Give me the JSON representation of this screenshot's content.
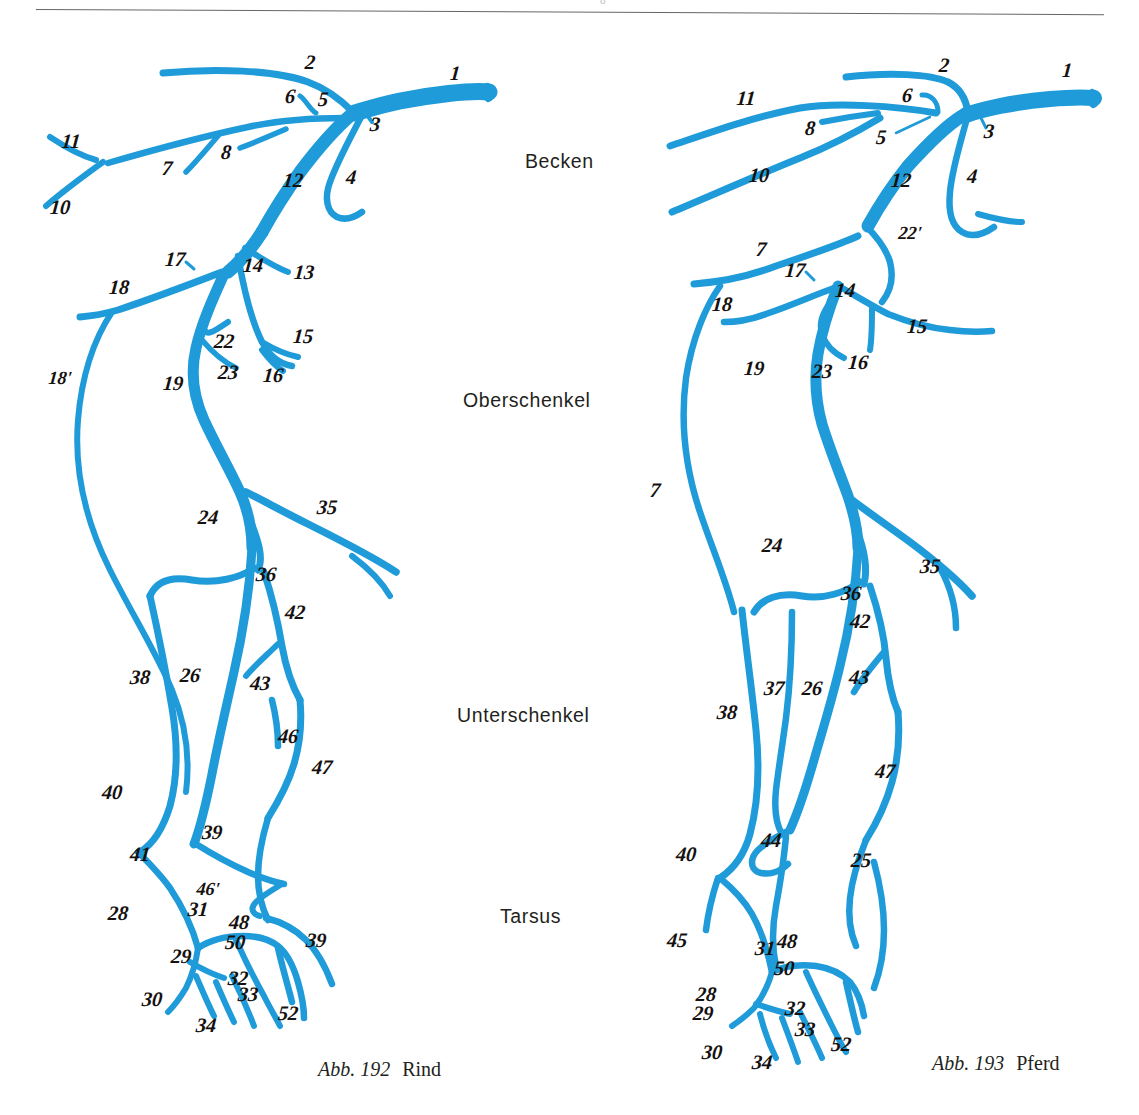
{
  "page": {
    "background": "#ffffff",
    "vessel_color": "#1f9bd9",
    "label_color": "#15110f",
    "rule_color": "#63676b",
    "header_ghost": "o"
  },
  "regions": [
    {
      "label": "Becken",
      "x": 525,
      "y": 150
    },
    {
      "label": "Oberschenkel",
      "x": 463,
      "y": 389
    },
    {
      "label": "Unterschenkel",
      "x": 457,
      "y": 704
    },
    {
      "label": "Tarsus",
      "x": 500,
      "y": 905
    }
  ],
  "figures": [
    {
      "id": "figure-rind",
      "caption_abb": "Abb. 192",
      "caption_name": "Rind",
      "caption_x": 318,
      "caption_y": 1058,
      "labels": [
        {
          "t": "1",
          "x": 455,
          "y": 73
        },
        {
          "t": "2",
          "x": 310,
          "y": 62
        },
        {
          "t": "3",
          "x": 375,
          "y": 124
        },
        {
          "t": "4",
          "x": 351,
          "y": 177
        },
        {
          "t": "5",
          "x": 323,
          "y": 99
        },
        {
          "t": "6",
          "x": 290,
          "y": 96
        },
        {
          "t": "7",
          "x": 167,
          "y": 168
        },
        {
          "t": "8",
          "x": 226,
          "y": 152
        },
        {
          "t": "10",
          "x": 60,
          "y": 207
        },
        {
          "t": "11",
          "x": 71,
          "y": 141
        },
        {
          "t": "12",
          "x": 293,
          "y": 180
        },
        {
          "t": "13",
          "x": 304,
          "y": 272
        },
        {
          "t": "14",
          "x": 253,
          "y": 265
        },
        {
          "t": "15",
          "x": 303,
          "y": 336
        },
        {
          "t": "16",
          "x": 273,
          "y": 375
        },
        {
          "t": "17",
          "x": 175,
          "y": 259
        },
        {
          "t": "18",
          "x": 119,
          "y": 287
        },
        {
          "t": "18'",
          "x": 60,
          "y": 378
        },
        {
          "t": "19",
          "x": 173,
          "y": 383
        },
        {
          "t": "22",
          "x": 224,
          "y": 341
        },
        {
          "t": "23",
          "x": 228,
          "y": 372
        },
        {
          "t": "24",
          "x": 208,
          "y": 517
        },
        {
          "t": "26",
          "x": 190,
          "y": 675
        },
        {
          "t": "28",
          "x": 118,
          "y": 913
        },
        {
          "t": "29",
          "x": 181,
          "y": 956
        },
        {
          "t": "30",
          "x": 152,
          "y": 999
        },
        {
          "t": "31",
          "x": 198,
          "y": 909
        },
        {
          "t": "32",
          "x": 238,
          "y": 978
        },
        {
          "t": "33",
          "x": 248,
          "y": 994
        },
        {
          "t": "34",
          "x": 206,
          "y": 1025
        },
        {
          "t": "35",
          "x": 327,
          "y": 507
        },
        {
          "t": "36",
          "x": 266,
          "y": 574
        },
        {
          "t": "38",
          "x": 140,
          "y": 677
        },
        {
          "t": "39",
          "x": 212,
          "y": 832
        },
        {
          "t": "39",
          "x": 316,
          "y": 940
        },
        {
          "t": "40",
          "x": 112,
          "y": 792
        },
        {
          "t": "41",
          "x": 140,
          "y": 854
        },
        {
          "t": "42",
          "x": 295,
          "y": 612
        },
        {
          "t": "43",
          "x": 260,
          "y": 683
        },
        {
          "t": "46",
          "x": 288,
          "y": 736
        },
        {
          "t": "46'",
          "x": 208,
          "y": 889
        },
        {
          "t": "47",
          "x": 322,
          "y": 767
        },
        {
          "t": "48",
          "x": 239,
          "y": 922
        },
        {
          "t": "50",
          "x": 235,
          "y": 942
        },
        {
          "t": "52",
          "x": 288,
          "y": 1013
        }
      ]
    },
    {
      "id": "figure-pferd",
      "caption_abb": "Abb. 193",
      "caption_name": "Pferd",
      "caption_x": 932,
      "caption_y": 1052,
      "labels": [
        {
          "t": "1",
          "x": 1067,
          "y": 70
        },
        {
          "t": "2",
          "x": 944,
          "y": 65
        },
        {
          "t": "3",
          "x": 989,
          "y": 131
        },
        {
          "t": "4",
          "x": 972,
          "y": 176
        },
        {
          "t": "5",
          "x": 881,
          "y": 137
        },
        {
          "t": "6",
          "x": 907,
          "y": 95
        },
        {
          "t": "7",
          "x": 761,
          "y": 249
        },
        {
          "t": "7",
          "x": 655,
          "y": 490
        },
        {
          "t": "8",
          "x": 810,
          "y": 128
        },
        {
          "t": "10",
          "x": 759,
          "y": 175
        },
        {
          "t": "11",
          "x": 746,
          "y": 98
        },
        {
          "t": "12",
          "x": 901,
          "y": 180
        },
        {
          "t": "14",
          "x": 845,
          "y": 290
        },
        {
          "t": "15",
          "x": 917,
          "y": 326
        },
        {
          "t": "16",
          "x": 858,
          "y": 362
        },
        {
          "t": "17",
          "x": 795,
          "y": 270
        },
        {
          "t": "18",
          "x": 722,
          "y": 304
        },
        {
          "t": "19",
          "x": 754,
          "y": 368
        },
        {
          "t": "22'",
          "x": 910,
          "y": 233
        },
        {
          "t": "23",
          "x": 822,
          "y": 371
        },
        {
          "t": "24",
          "x": 772,
          "y": 545
        },
        {
          "t": "25",
          "x": 861,
          "y": 860
        },
        {
          "t": "26",
          "x": 812,
          "y": 688
        },
        {
          "t": "28",
          "x": 706,
          "y": 994
        },
        {
          "t": "29",
          "x": 703,
          "y": 1013
        },
        {
          "t": "30",
          "x": 712,
          "y": 1052
        },
        {
          "t": "31",
          "x": 765,
          "y": 948
        },
        {
          "t": "32",
          "x": 795,
          "y": 1008
        },
        {
          "t": "33",
          "x": 805,
          "y": 1029
        },
        {
          "t": "34",
          "x": 762,
          "y": 1062
        },
        {
          "t": "35",
          "x": 930,
          "y": 566
        },
        {
          "t": "36",
          "x": 851,
          "y": 593
        },
        {
          "t": "37",
          "x": 774,
          "y": 688
        },
        {
          "t": "38",
          "x": 727,
          "y": 712
        },
        {
          "t": "40",
          "x": 686,
          "y": 854
        },
        {
          "t": "42",
          "x": 860,
          "y": 621
        },
        {
          "t": "43",
          "x": 859,
          "y": 677
        },
        {
          "t": "44",
          "x": 771,
          "y": 840
        },
        {
          "t": "45",
          "x": 677,
          "y": 940
        },
        {
          "t": "47",
          "x": 885,
          "y": 771
        },
        {
          "t": "48",
          "x": 787,
          "y": 941
        },
        {
          "t": "50",
          "x": 784,
          "y": 968
        },
        {
          "t": "52",
          "x": 841,
          "y": 1044
        }
      ]
    }
  ]
}
